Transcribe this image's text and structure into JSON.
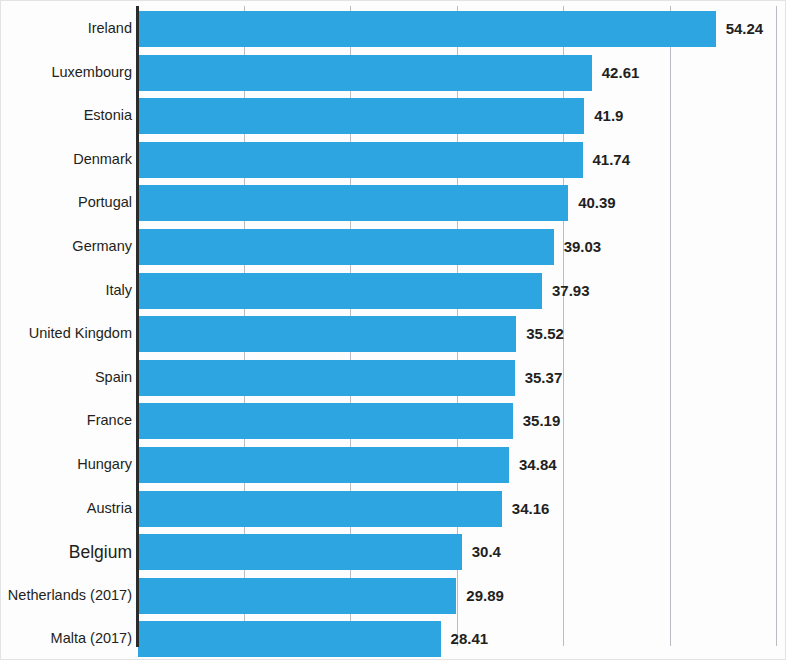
{
  "chart": {
    "title": "",
    "subtitle": "",
    "axis_line_color": "#2b2b2b",
    "bar_color": "#2ca5e0",
    "gridline_color": "#b9bcc0",
    "label_color": "#231f20",
    "background": "#fdfdfd"
  },
  "chart_data": {
    "type": "bar",
    "orientation": "horizontal",
    "title": "",
    "xlabel": "",
    "ylabel": "",
    "xlim": [
      0,
      60.9
    ],
    "grid": true,
    "gridlines": [
      0,
      10,
      20,
      30,
      40,
      50,
      60
    ],
    "legend": null,
    "categories": [
      "Ireland",
      "Luxembourg",
      "Estonia",
      "Denmark",
      "Portugal",
      "Germany",
      "Italy",
      "United Kingdom",
      "Spain",
      "France",
      "Hungary",
      "Austria",
      "Belgium",
      "Netherlands (2017)",
      "Malta (2017)"
    ],
    "values": [
      54.24,
      42.61,
      41.9,
      41.74,
      40.39,
      39.03,
      37.93,
      35.52,
      35.37,
      35.19,
      34.84,
      34.16,
      30.4,
      29.89,
      28.41
    ],
    "value_labels": [
      "54.24",
      "42.61",
      "41.9",
      "41.74",
      "40.39",
      "39.03",
      "37.93",
      "35.52",
      "35.37",
      "35.19",
      "34.84",
      "34.16",
      "30.4",
      "29.89",
      "28.41"
    ],
    "emphasized_category": "Belgium"
  }
}
